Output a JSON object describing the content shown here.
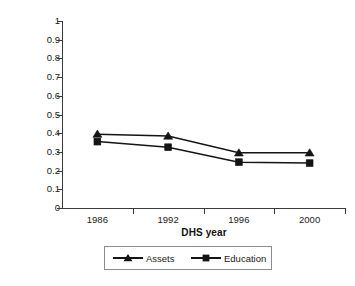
{
  "chart_data": {
    "type": "line",
    "title": "",
    "xlabel": "DHS year",
    "ylabel": "Level of regional HI",
    "categories": [
      "1986",
      "1992",
      "1996",
      "2000"
    ],
    "x": [
      1986,
      1992,
      1996,
      2000
    ],
    "ylim": [
      0,
      1
    ],
    "yticks": [
      0,
      0.1,
      0.2,
      0.3,
      0.4,
      0.5,
      0.6,
      0.7,
      0.8,
      0.9,
      1
    ],
    "ytick_labels": [
      "0",
      "0.1",
      "0.2",
      "0.3",
      "0.4",
      "0.5",
      "0.6",
      "0.7",
      "0.8",
      "0.9",
      "1"
    ],
    "grid": false,
    "legend_position": "bottom",
    "series": [
      {
        "name": "Assets",
        "marker": "triangle",
        "color": "#141414",
        "values": [
          0.395,
          0.385,
          0.295,
          0.295
        ]
      },
      {
        "name": "Education",
        "marker": "square",
        "color": "#141414",
        "values": [
          0.355,
          0.325,
          0.245,
          0.24
        ]
      }
    ]
  },
  "axes": {
    "y_title": "Level of regional HI",
    "x_title": "DHS year",
    "y_tick_labels": [
      "1",
      "0.9",
      "0.8",
      "0.7",
      "0.6",
      "0.5",
      "0.4",
      "0.3",
      "0.2",
      "0.1",
      "0"
    ],
    "x_tick_labels": [
      "1986",
      "1992",
      "1996",
      "2000"
    ]
  },
  "legend": {
    "items": [
      {
        "label": "Assets",
        "marker": "triangle-marker-icon"
      },
      {
        "label": "Education",
        "marker": "square-marker-icon"
      }
    ]
  }
}
